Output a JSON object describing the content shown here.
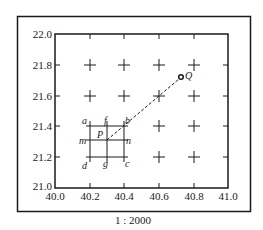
{
  "diagram": {
    "scale_label": "1 : 2000",
    "x_axis": {
      "min": 40.0,
      "max": 41.0,
      "ticks": [
        "40.0",
        "40.2",
        "40.4",
        "40.6",
        "40.8",
        "41.0"
      ]
    },
    "y_axis": {
      "min": 21.0,
      "max": 22.0,
      "ticks": [
        "21.0",
        "21.2",
        "21.4",
        "21.6",
        "21.8",
        "22.0"
      ]
    },
    "grid_crosses": [
      [
        40.2,
        21.8
      ],
      [
        40.4,
        21.8
      ],
      [
        40.6,
        21.8
      ],
      [
        40.8,
        21.8
      ],
      [
        40.2,
        21.6
      ],
      [
        40.4,
        21.6
      ],
      [
        40.6,
        21.6
      ],
      [
        40.8,
        21.6
      ],
      [
        40.6,
        21.4
      ],
      [
        40.8,
        21.4
      ],
      [
        40.6,
        21.2
      ],
      [
        40.8,
        21.2
      ]
    ],
    "square_labels": {
      "a": "a",
      "b": "b",
      "c": "c",
      "d": "d",
      "f": "f",
      "g": "g",
      "m": "m",
      "n": "n",
      "P": "P"
    },
    "point_q": {
      "label": "Q",
      "x": 40.73,
      "y": 21.71
    },
    "point_p": {
      "label": "P",
      "x": 40.3,
      "y": 21.3
    },
    "colors": {
      "line": "#1a1a1a",
      "background": "#ffffff"
    }
  }
}
